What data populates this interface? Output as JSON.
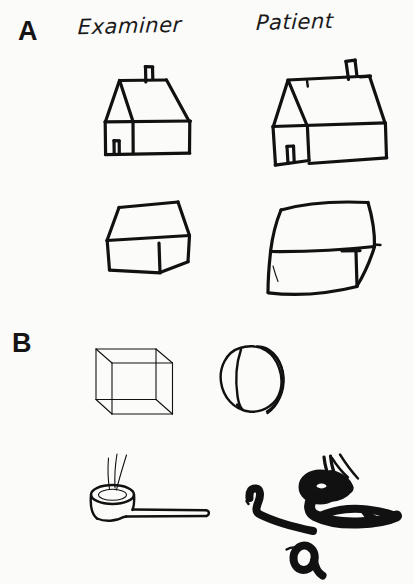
{
  "figure": {
    "background_color": "#fbfbfa",
    "ink_color": "#111111",
    "width": 414,
    "height": 584
  },
  "panels": [
    {
      "label": "A",
      "columns": [
        {
          "heading": "Examiner"
        },
        {
          "heading": "Patient"
        }
      ],
      "rows": [
        {
          "model_name": "house-drawing",
          "copy_name": "house-drawing-copy"
        },
        {
          "model_name": "box-drawing",
          "copy_name": "box-drawing-copy"
        }
      ]
    },
    {
      "label": "B",
      "rows": [
        {
          "model_name": "wireframe-cube-drawing",
          "copy_name": "blob-drawing-copy"
        },
        {
          "model_name": "pipe-drawing",
          "copy_name": "scribble-drawing-copy"
        }
      ]
    }
  ],
  "labels": {
    "panel_a": "A",
    "panel_b": "B",
    "examiner": "Examiner",
    "patient": "Patient"
  }
}
